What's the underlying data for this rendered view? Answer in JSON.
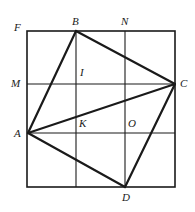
{
  "figure": {
    "kind": "geometry-diagram",
    "canvas": {
      "width": 195,
      "height": 212
    },
    "stroke_color": "#1a1a1a",
    "label_color": "#1a1a1a",
    "background_color": "#ffffff"
  },
  "outer_square": {
    "name": "outer-square",
    "x": 27,
    "y": 31,
    "width": 148,
    "height": 156,
    "stroke_width": 1.6
  },
  "grid": {
    "stroke_width": 1.1,
    "vertical_lines": [
      {
        "name": "grid-line-v1",
        "x": 76,
        "y1": 31,
        "y2": 187
      },
      {
        "name": "grid-line-v2",
        "x": 125,
        "y1": 31,
        "y2": 187
      }
    ],
    "horizontal_lines": [
      {
        "name": "grid-line-h1",
        "y": 84,
        "x1": 27,
        "x2": 175
      },
      {
        "name": "grid-line-h2",
        "y": 133,
        "x1": 27,
        "x2": 175
      }
    ]
  },
  "quadrilateral": {
    "name": "quadrilateral-ABCD",
    "stroke_width": 2.2,
    "points": "76,31 175,84 125,187 28,133",
    "edges": [
      {
        "name": "segment-AB",
        "from": "A",
        "to": "B",
        "x1": 28,
        "y1": 133,
        "x2": 76,
        "y2": 31
      },
      {
        "name": "segment-BC",
        "from": "B",
        "to": "C",
        "x1": 76,
        "y1": 31,
        "x2": 175,
        "y2": 84
      },
      {
        "name": "segment-CD",
        "from": "C",
        "to": "D",
        "x1": 175,
        "y1": 84,
        "x2": 125,
        "y2": 187
      },
      {
        "name": "segment-DA",
        "from": "D",
        "to": "A",
        "x1": 125,
        "y1": 187,
        "x2": 28,
        "y2": 133
      }
    ]
  },
  "diagonals": {
    "stroke_width": 2.0,
    "segments": [
      {
        "name": "diagonal-AC",
        "from": "A",
        "to": "C",
        "x1": 28,
        "y1": 133,
        "x2": 175,
        "y2": 84
      }
    ]
  },
  "labels": [
    {
      "id": "F",
      "name": "point-label-F",
      "text": "F",
      "x": 14,
      "y": 22
    },
    {
      "id": "B",
      "name": "point-label-B",
      "text": "B",
      "x": 72,
      "y": 16
    },
    {
      "id": "N",
      "name": "point-label-N",
      "text": "N",
      "x": 121,
      "y": 16
    },
    {
      "id": "M",
      "name": "point-label-M",
      "text": "M",
      "x": 11,
      "y": 78
    },
    {
      "id": "C",
      "name": "point-label-C",
      "text": "C",
      "x": 180,
      "y": 78
    },
    {
      "id": "I",
      "name": "point-label-I",
      "text": "I",
      "x": 80,
      "y": 67
    },
    {
      "id": "A",
      "name": "point-label-A",
      "text": "A",
      "x": 14,
      "y": 128
    },
    {
      "id": "K",
      "name": "point-label-K",
      "text": "K",
      "x": 79,
      "y": 118
    },
    {
      "id": "O",
      "name": "point-label-O",
      "text": "O",
      "x": 128,
      "y": 118
    },
    {
      "id": "D",
      "name": "point-label-D",
      "text": "D",
      "x": 122,
      "y": 192
    }
  ]
}
